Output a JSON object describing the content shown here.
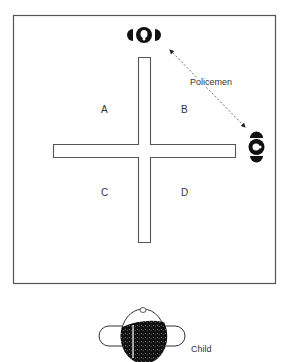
{
  "diagram": {
    "quadrants": [
      {
        "label": "A"
      },
      {
        "label": "B"
      },
      {
        "label": "C"
      },
      {
        "label": "D"
      }
    ],
    "policemen_label": "Policemen",
    "child_label": "Child",
    "colors": {
      "line": "#444444",
      "figure": "#111111",
      "background": "#ffffff"
    }
  }
}
